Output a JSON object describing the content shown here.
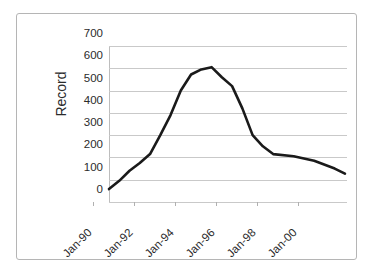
{
  "chart_data": {
    "type": "line",
    "title": "",
    "subtitle": "",
    "xlabel": "",
    "ylabel": "Record",
    "ylim": [
      0,
      700
    ],
    "y_ticks": [
      0,
      100,
      200,
      300,
      400,
      500,
      600,
      700
    ],
    "y_tick_labels": [
      "0",
      "100",
      "200",
      "300",
      "400",
      "500",
      "600",
      "700"
    ],
    "x_tick_labels": [
      "Jan-90",
      "Jan-92",
      "Jan-94",
      "Jan-96",
      "Jan-98",
      "Jan-00"
    ],
    "x_tick_values": [
      1990,
      1992,
      1994,
      1996,
      1998,
      2000
    ],
    "xlim": [
      1990,
      2001.6
    ],
    "grid": "horizontal",
    "legend": "none",
    "series": [
      {
        "name": "Record",
        "color": "#1a1a1a",
        "line_width": 2.6,
        "x": [
          1990.0,
          1990.5,
          1991.0,
          1991.5,
          1992.0,
          1992.5,
          1993.0,
          1993.5,
          1994.0,
          1994.5,
          1995.0,
          1995.5,
          1996.0,
          1996.5,
          1997.0,
          1997.5,
          1998.0,
          1999.0,
          2000.0,
          2001.0,
          2001.5
        ],
        "values": [
          58,
          95,
          140,
          175,
          215,
          300,
          390,
          500,
          572,
          595,
          605,
          560,
          520,
          420,
          300,
          250,
          215,
          205,
          185,
          150,
          127
        ]
      }
    ],
    "annotations": []
  },
  "axis": {
    "y_title": "Record"
  }
}
